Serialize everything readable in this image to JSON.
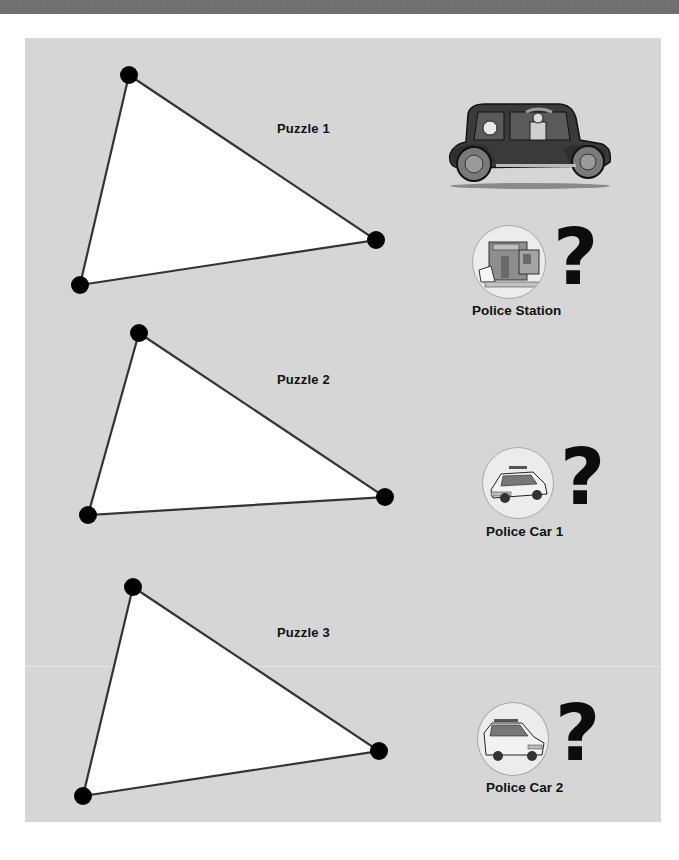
{
  "puzzles": [
    {
      "label": "Puzzle 1",
      "vertices": [
        [
          129,
          75
        ],
        [
          376,
          240
        ],
        [
          80,
          285
        ]
      ],
      "target": {
        "label": "Police Station",
        "icon": "police-station-icon",
        "mark": "?"
      }
    },
    {
      "label": "Puzzle 2",
      "vertices": [
        [
          139,
          333
        ],
        [
          385,
          497
        ],
        [
          88,
          515
        ]
      ],
      "target": {
        "label": "Police Car 1",
        "icon": "police-car-icon",
        "mark": "?"
      }
    },
    {
      "label": "Puzzle 3",
      "vertices": [
        [
          133,
          587
        ],
        [
          379,
          751
        ],
        [
          83,
          796
        ]
      ],
      "target": {
        "label": "Police Car 2",
        "icon": "police-car-icon",
        "mark": "?"
      }
    }
  ],
  "hero": {
    "icon": "getaway-car-icon"
  },
  "colors": {
    "panel": "#d6d6d6",
    "top_bar": "#707070",
    "triangle_fill": "#ffffff",
    "triangle_stroke": "#333333",
    "vertex": "#000000"
  }
}
